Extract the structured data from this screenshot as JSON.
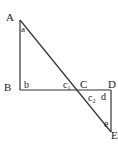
{
  "diagram": {
    "points": {
      "A": {
        "label": "A",
        "x": 20,
        "y": 20
      },
      "B": {
        "label": "B",
        "x": 20,
        "y": 90
      },
      "C": {
        "label": "C",
        "x": 80,
        "y": 90
      },
      "D": {
        "label": "D",
        "x": 111,
        "y": 90
      },
      "E": {
        "label": "E",
        "x": 111,
        "y": 132
      }
    },
    "vertex_labels": [
      "A",
      "B",
      "C",
      "D",
      "E"
    ],
    "angle_labels": {
      "a": "a",
      "b": "b",
      "c1": "c",
      "c1_sub": "1",
      "c2": "c",
      "c2_sub": "2",
      "d": "d",
      "e": "e"
    },
    "segments": [
      "AB",
      "BD",
      "AE",
      "DE"
    ]
  }
}
